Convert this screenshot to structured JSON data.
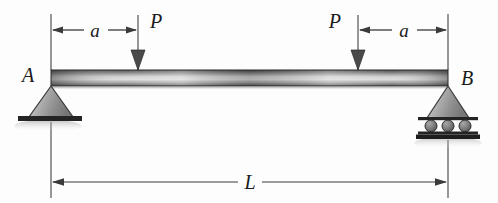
{
  "figure": {
    "background_color": "#fdfdfd",
    "ink_color": "#1a1a1a"
  },
  "beam": {
    "name": "beam",
    "left_x": 51,
    "right_x": 448,
    "top_y": 70,
    "bottom_y": 86,
    "gradient_stops": [
      "#4a4a4a",
      "#8e8e8e",
      "#d8d8d8",
      "#9a9a9a",
      "#5a5a5a"
    ]
  },
  "supports": {
    "left": {
      "label": "A",
      "type": "pin",
      "x": 51,
      "label_x": 28,
      "label_y": 82,
      "triangle_half_width": 22,
      "triangle_base_y": 117,
      "ground_y": 117,
      "ground_half_width": 33
    },
    "right": {
      "label": "B",
      "type": "roller",
      "x": 448,
      "label_x": 459,
      "label_y": 84,
      "triangle_half_width": 22,
      "triangle_base_y": 117,
      "roller_line_top_y": 119,
      "roller_line_bottom_y": 133,
      "roller_count": 3,
      "roller_radius": 6,
      "roller_centers_x": [
        432,
        448,
        464
      ],
      "ground_y": 135,
      "ground_half_width": 33
    }
  },
  "loads": [
    {
      "label": "P",
      "name": "point-load-left",
      "x": 138,
      "top_y": 15,
      "tip_y": 70,
      "label_x": 150,
      "label_y": 27,
      "direction": "down"
    },
    {
      "label": "P",
      "name": "point-load-right",
      "x": 358,
      "top_y": 15,
      "tip_y": 70,
      "label_x": 334,
      "label_y": 27,
      "direction": "down"
    }
  ],
  "dimensions": [
    {
      "label": "a",
      "name": "dimension-a-left",
      "from_x": 51,
      "to_x": 138,
      "y": 30,
      "label_x": 95,
      "label_y": 36,
      "extension_top_y": 14,
      "extension_bottom_y": 70
    },
    {
      "label": "a",
      "name": "dimension-a-right",
      "from_x": 358,
      "to_x": 448,
      "y": 30,
      "label_x": 404,
      "label_y": 36,
      "extension_top_y": 14,
      "extension_bottom_y": 70
    },
    {
      "label": "L",
      "name": "dimension-span-L",
      "from_x": 51,
      "to_x": 448,
      "y": 182,
      "label_x": 250,
      "label_y": 189,
      "extension_top_y": 120,
      "extension_bottom_y": 198
    }
  ]
}
